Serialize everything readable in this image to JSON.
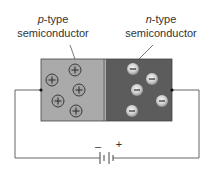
{
  "labels": {
    "p_type": {
      "prefix": "p",
      "suffix": "-type",
      "line2": "semiconductor"
    },
    "n_type": {
      "prefix": "n",
      "suffix": "-type",
      "line2": "semiconductor"
    }
  },
  "battery": {
    "minus": "–",
    "plus": "+"
  },
  "regions": {
    "p": {
      "name": "p-type region",
      "color": "#aaaaaa",
      "carrier": "hole",
      "carrier_count": 5
    },
    "n": {
      "name": "n-type region",
      "color": "#5c5c5c",
      "carrier": "electron",
      "carrier_count": 5
    }
  },
  "colors": {
    "wire": "#555555",
    "border": "#444444",
    "hole_ring": "#3a3a3a",
    "electron_light": "#e8e8e8",
    "electron_dark": "#9a9a9a",
    "sign": "#2a2a2a"
  }
}
